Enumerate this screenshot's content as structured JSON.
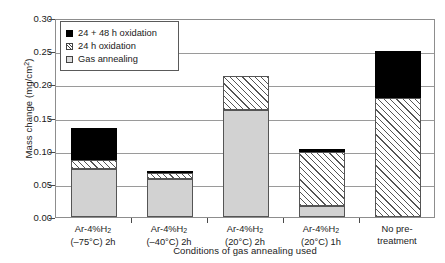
{
  "chart_data": {
    "type": "bar",
    "stacked": true,
    "title": "",
    "xlabel": "Conditions of gas annealing used",
    "ylabel": "Mass change (mg/cm2)",
    "ylabel_parts": {
      "text": "Mass change (mg/cm",
      "sup": "2",
      "tail": ")"
    },
    "ylim": [
      0,
      0.3
    ],
    "ytick_values": [
      0.0,
      0.05,
      0.1,
      0.15,
      0.2,
      0.25,
      0.3
    ],
    "ytick_labels": [
      "0.00",
      "0.05",
      "0.10",
      "0.15",
      "0.20",
      "0.25",
      "0.30"
    ],
    "grid": true,
    "legend_position": "upper-left-inside",
    "categories": [
      "Ar-4%H2 (-75C) 2h",
      "Ar-4%H2 (-40C) 2h",
      "Ar-4%H2 (20C) 2h",
      "Ar-4%H2 (20C) 1h",
      "No pre-treatment"
    ],
    "category_labels": [
      {
        "line1_pre": "Ar-4%H",
        "line1_sub": "2",
        "line1_post": "",
        "line2": "(–75°C) 2h"
      },
      {
        "line1_pre": "Ar-4%H",
        "line1_sub": "2",
        "line1_post": "",
        "line2": "(–40°C) 2h"
      },
      {
        "line1_pre": "Ar-4%H",
        "line1_sub": "2",
        "line1_post": "",
        "line2": "(20°C) 2h"
      },
      {
        "line1_pre": "Ar-4%H",
        "line1_sub": "2",
        "line1_post": "",
        "line2": "(20°C) 1h"
      },
      {
        "line1_pre": "No pre-",
        "line1_sub": "",
        "line1_post": "",
        "line2": "treatment"
      }
    ],
    "series": [
      {
        "name": "Gas annealing",
        "key": "gas",
        "color": "#d2d2d2",
        "fill": "solid-light-gray",
        "values": [
          0.073,
          0.058,
          0.162,
          0.017,
          0.0
        ]
      },
      {
        "name": "24 h oxidation",
        "key": "h24",
        "color": "#ffffff",
        "fill": "diagonal-hatch",
        "values": [
          0.013,
          0.008,
          0.05,
          0.081,
          0.18
        ]
      },
      {
        "name": "24 + 48 h oxidation",
        "key": "h2448",
        "color": "#000000",
        "fill": "solid-black",
        "values": [
          0.048,
          0.002,
          0.0,
          0.004,
          0.07
        ]
      }
    ],
    "totals": [
      0.134,
      0.068,
      0.212,
      0.102,
      0.25
    ],
    "legend": [
      {
        "label": "24 + 48 h oxidation",
        "swatch": "black-square"
      },
      {
        "label": "24 h oxidation",
        "swatch": "hatched-square"
      },
      {
        "label": "Gas annealing",
        "swatch": "gray-square"
      }
    ]
  }
}
